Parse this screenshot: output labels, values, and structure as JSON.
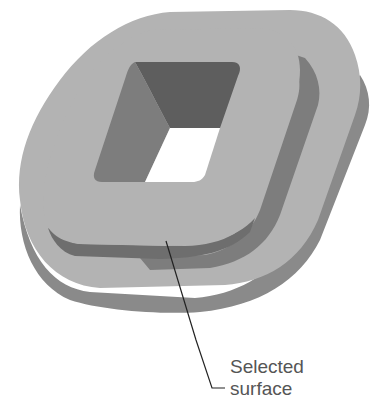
{
  "figure": {
    "callout": {
      "line1": "Selected",
      "line2": "surface"
    },
    "colors": {
      "background": "#ffffff",
      "top_face": "#b3b3b3",
      "side_face": "#8a8a8a",
      "ledge_wall": "#7a7a7a",
      "hole_dark": "#5e5e5e",
      "hole_mid": "#7d7d7d",
      "leader_line": "#222222",
      "label_text": "#555555"
    }
  }
}
